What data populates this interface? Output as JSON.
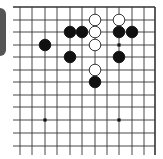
{
  "diagram": {
    "type": "go-board-fragment",
    "view": "upper-right corner region",
    "grid": {
      "columns_x": [
        20,
        32,
        45,
        57,
        70,
        82,
        95,
        107,
        119,
        132,
        144,
        155
      ],
      "rows_y": [
        7,
        20,
        32,
        45,
        57,
        70,
        82,
        95,
        107,
        120,
        133,
        146
      ],
      "line_start_x": 13,
      "line_end_y": 155,
      "edges": [
        "top",
        "right"
      ]
    },
    "star_points": [
      {
        "col": 8,
        "row": 3
      },
      {
        "col": 2,
        "row": 9
      },
      {
        "col": 8,
        "row": 9
      }
    ],
    "stones": [
      {
        "color": "white",
        "col": 6,
        "row": 1
      },
      {
        "color": "white",
        "col": 8,
        "row": 1
      },
      {
        "color": "black",
        "col": 4,
        "row": 2
      },
      {
        "color": "black",
        "col": 5,
        "row": 2
      },
      {
        "color": "white",
        "col": 6,
        "row": 2
      },
      {
        "color": "black",
        "col": 8,
        "row": 2
      },
      {
        "color": "black",
        "col": 9,
        "row": 2
      },
      {
        "color": "black",
        "col": 2,
        "row": 3
      },
      {
        "color": "white",
        "col": 6,
        "row": 3
      },
      {
        "color": "black",
        "col": 4,
        "row": 4
      },
      {
        "color": "black",
        "col": 8,
        "row": 4
      },
      {
        "color": "white",
        "col": 6,
        "row": 5
      },
      {
        "color": "black",
        "col": 6,
        "row": 6
      }
    ],
    "colors": {
      "line": "#333333",
      "black_stone": "#111111",
      "white_stone_fill": "#ffffff",
      "white_stone_stroke": "#222222",
      "side_tab": "#555555"
    }
  }
}
